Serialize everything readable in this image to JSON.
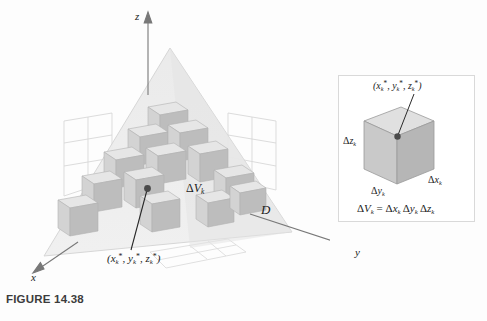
{
  "figure": {
    "caption": "FIGURE 14.38",
    "axes": {
      "z_label": "z",
      "y_label": "y",
      "x_label": "x"
    },
    "region_label": "D",
    "volume_label_delta": "Δ",
    "volume_label_V": "V",
    "volume_label_sub": "k",
    "sample_point": {
      "open_paren": "(",
      "x": "x",
      "y": "y",
      "z": "z",
      "sub": "k",
      "star": "*",
      "comma": ", ",
      "close_paren": ")"
    }
  },
  "inset": {
    "point_label": {
      "open_paren": "(",
      "x": "x",
      "y": "y",
      "z": "z",
      "sub": "k",
      "star": "*",
      "comma": ", ",
      "close_paren": ")"
    },
    "dz_delta": "Δ",
    "dz_var": "z",
    "dz_sub": "k",
    "dy_delta": "Δ",
    "dy_var": "y",
    "dy_sub": "k",
    "dx_delta": "Δ",
    "dx_var": "x",
    "dx_sub": "k",
    "equation": {
      "lhs_delta": "Δ",
      "lhs_var": "V",
      "lhs_sub": "k",
      "equals": " = ",
      "t1_delta": "Δ",
      "t1_var": "x",
      "t1_sub": "k",
      "t2_delta": "Δ",
      "t2_var": "y",
      "t2_sub": "k",
      "t3_delta": "Δ",
      "t3_var": "z",
      "t3_sub": "k"
    }
  },
  "colors": {
    "tetra_fill": "#ececec",
    "tetra_edge": "#cfcfcf",
    "grid_line": "#d6d6d6",
    "cube_front": "#bcbcbc",
    "cube_top": "#e4e4e4",
    "cube_side": "#d2d2d2",
    "axis": "#6f6f6f",
    "text": "#1b1b1b",
    "caption": "#3c3c3c",
    "inset_border": "#d9d9d9"
  }
}
